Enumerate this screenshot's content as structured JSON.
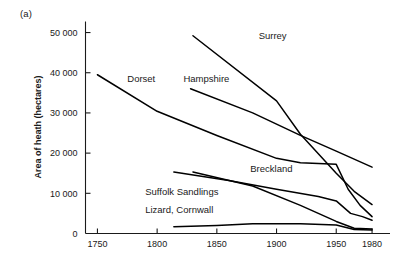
{
  "panel": {
    "label": "(a)"
  },
  "axes": {
    "ylabel": "Area of heath (hectares)",
    "xlabel": "",
    "y_ticks": [
      "0",
      "10 000",
      "20 000",
      "30 000",
      "40 000",
      "50 000"
    ],
    "y_tick_values": [
      0,
      10000,
      20000,
      30000,
      40000,
      50000
    ],
    "x_ticks": [
      "1750",
      "1800",
      "1850",
      "1900",
      "1950",
      "1980"
    ],
    "x_tick_values": [
      1750,
      1800,
      1850,
      1900,
      1950,
      1980
    ],
    "xlim": [
      1740,
      1990
    ],
    "ylim": [
      0,
      52000
    ],
    "grid": false,
    "line_color": "#1a1a1a"
  },
  "chart_data": {
    "type": "line",
    "title": "",
    "subtitle": "",
    "xlabel": "",
    "ylabel": "Area of heath (hectares)",
    "xlim": [
      1740,
      1990
    ],
    "ylim": [
      0,
      52000
    ],
    "grid": false,
    "legend_position": "inline-labels",
    "x_tick_labels": [
      "1750",
      "1800",
      "1850",
      "1900",
      "1950",
      "1980"
    ],
    "y_tick_labels": [
      "0",
      "10 000",
      "20 000",
      "30 000",
      "40 000",
      "50 000"
    ],
    "annotations": [
      {
        "text": "(a)",
        "position": "top-left-outside"
      }
    ],
    "series": [
      {
        "name": "Surrey",
        "label": "Surrey",
        "label_x": 1885,
        "label_y": 48500,
        "points": [
          {
            "x": 1830,
            "y": 49200
          },
          {
            "x": 1900,
            "y": 33000
          },
          {
            "x": 1920,
            "y": 24700
          },
          {
            "x": 1950,
            "y": 15000
          },
          {
            "x": 1965,
            "y": 10500
          },
          {
            "x": 1980,
            "y": 7200
          }
        ]
      },
      {
        "name": "Dorset",
        "label": "Dorset",
        "label_x": 1775,
        "label_y": 37800,
        "points": [
          {
            "x": 1750,
            "y": 39500
          },
          {
            "x": 1800,
            "y": 30400
          },
          {
            "x": 1850,
            "y": 24400
          },
          {
            "x": 1900,
            "y": 18700
          },
          {
            "x": 1920,
            "y": 17600
          },
          {
            "x": 1935,
            "y": 17400
          },
          {
            "x": 1950,
            "y": 17200
          },
          {
            "x": 1960,
            "y": 11000
          },
          {
            "x": 1970,
            "y": 7000
          },
          {
            "x": 1980,
            "y": 4200
          }
        ]
      },
      {
        "name": "Hampshire",
        "label": "Hampshire",
        "label_x": 1822,
        "label_y": 37800,
        "points": [
          {
            "x": 1828,
            "y": 36000
          },
          {
            "x": 1880,
            "y": 30000
          },
          {
            "x": 1920,
            "y": 24400
          },
          {
            "x": 1950,
            "y": 20500
          },
          {
            "x": 1980,
            "y": 16500
          }
        ]
      },
      {
        "name": "Breckland",
        "label": "Breckland",
        "label_x": 1878,
        "label_y": 15400,
        "points": [
          {
            "x": 1814,
            "y": 15300
          },
          {
            "x": 1860,
            "y": 13200
          },
          {
            "x": 1900,
            "y": 11000
          },
          {
            "x": 1935,
            "y": 9200
          },
          {
            "x": 1950,
            "y": 8100
          },
          {
            "x": 1962,
            "y": 5000
          },
          {
            "x": 1972,
            "y": 4200
          },
          {
            "x": 1980,
            "y": 3300
          }
        ]
      },
      {
        "name": "Suffolk Sandlings",
        "label": "Suffolk Sandlings",
        "label_x": 1790,
        "label_y": 9700,
        "points": [
          {
            "x": 1830,
            "y": 15300
          },
          {
            "x": 1880,
            "y": 11800
          },
          {
            "x": 1920,
            "y": 7000
          },
          {
            "x": 1950,
            "y": 3000
          },
          {
            "x": 1965,
            "y": 1300
          },
          {
            "x": 1980,
            "y": 1100
          }
        ]
      },
      {
        "name": "Lizard, Cornwall",
        "label": "Lizard, Cornwall",
        "label_x": 1790,
        "label_y": 5200,
        "points": [
          {
            "x": 1814,
            "y": 1700
          },
          {
            "x": 1850,
            "y": 2000
          },
          {
            "x": 1880,
            "y": 2400
          },
          {
            "x": 1920,
            "y": 2400
          },
          {
            "x": 1950,
            "y": 2100
          },
          {
            "x": 1965,
            "y": 1000
          },
          {
            "x": 1980,
            "y": 900
          }
        ]
      }
    ]
  }
}
